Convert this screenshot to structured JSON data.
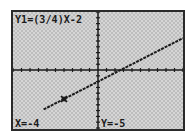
{
  "screen": {
    "equation": "Y1=(3/4)X-2",
    "trace_x": "X=-4",
    "trace_y": "Y=-5"
  },
  "window": {
    "xmin": -10,
    "xmax": 10,
    "ymin": -10,
    "ymax": 10,
    "xscl": 1,
    "yscl": 1
  },
  "function": {
    "slope": 0.75,
    "intercept": -2
  },
  "cursor": {
    "x": -4,
    "y": -5
  },
  "colors": {
    "ink": "#1a1a1a",
    "background_light": "#d6d6d6",
    "background_dither": "#bdbdbd",
    "frame": "#2a2a2a"
  }
}
